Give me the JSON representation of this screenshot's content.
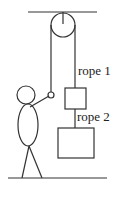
{
  "diagram": {
    "labels": {
      "rope1": "rope 1",
      "rope2": "rope 2"
    },
    "colors": {
      "stroke": "#333333",
      "background": "#ffffff"
    },
    "components": [
      "ceiling",
      "pulley",
      "rope 1",
      "block 1",
      "rope 2",
      "block 2",
      "person",
      "floor"
    ]
  }
}
